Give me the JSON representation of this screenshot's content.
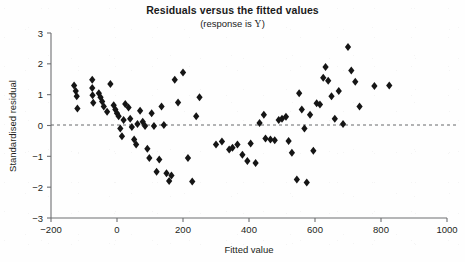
{
  "chart_data": {
    "type": "scatter",
    "title": "Residuals versus the fitted values",
    "subtitle_prefix": "(response is ",
    "subtitle_variable": "Y",
    "subtitle_suffix": ")",
    "xlabel": "Fitted value",
    "ylabel": "Standardised residual",
    "xlim": [
      -200,
      1000
    ],
    "ylim": [
      -3,
      3
    ],
    "xticks": [
      -200,
      0,
      200,
      400,
      600,
      800,
      1000
    ],
    "xtick_labels": [
      "-200",
      "0",
      "200",
      "400",
      "600",
      "800",
      "1000"
    ],
    "yticks": [
      -3,
      -2,
      -1,
      0,
      1,
      2,
      3
    ],
    "ytick_labels": [
      "-3",
      "-2",
      "-1",
      "0",
      "1",
      "2",
      "3"
    ],
    "grid": false,
    "legend": null,
    "reference_line": {
      "orientation": "horizontal",
      "value": 0,
      "style": "dashed"
    },
    "marker": {
      "shape": "diamond",
      "color": "#151515",
      "size": 4
    },
    "points": [
      [
        -130,
        1.3
      ],
      [
        -125,
        1.12
      ],
      [
        -122,
        0.95
      ],
      [
        -120,
        0.55
      ],
      [
        -75,
        1.48
      ],
      [
        -75,
        1.22
      ],
      [
        -74,
        0.98
      ],
      [
        -72,
        0.74
      ],
      [
        -55,
        1.05
      ],
      [
        -50,
        0.92
      ],
      [
        -45,
        0.78
      ],
      [
        -40,
        0.62
      ],
      [
        -30,
        0.45
      ],
      [
        -20,
        1.35
      ],
      [
        -10,
        0.66
      ],
      [
        -5,
        0.52
      ],
      [
        0,
        0.4
      ],
      [
        5,
        0.3
      ],
      [
        10,
        -0.1
      ],
      [
        15,
        -0.35
      ],
      [
        20,
        0.18
      ],
      [
        25,
        0.7
      ],
      [
        35,
        0.58
      ],
      [
        40,
        0.22
      ],
      [
        45,
        -0.05
      ],
      [
        52,
        -0.45
      ],
      [
        58,
        -0.62
      ],
      [
        62,
        0.05
      ],
      [
        70,
        0.48
      ],
      [
        78,
        0.12
      ],
      [
        85,
        -0.02
      ],
      [
        92,
        -0.75
      ],
      [
        98,
        -1.05
      ],
      [
        105,
        0.4
      ],
      [
        112,
        -0.02
      ],
      [
        120,
        -1.5
      ],
      [
        128,
        -1.1
      ],
      [
        135,
        0.62
      ],
      [
        142,
        0.02
      ],
      [
        150,
        -1.55
      ],
      [
        158,
        -1.8
      ],
      [
        165,
        -1.62
      ],
      [
        175,
        1.48
      ],
      [
        185,
        0.75
      ],
      [
        200,
        1.72
      ],
      [
        215,
        -1.05
      ],
      [
        228,
        -1.82
      ],
      [
        240,
        0.3
      ],
      [
        250,
        0.92
      ],
      [
        300,
        -0.62
      ],
      [
        318,
        -0.52
      ],
      [
        340,
        -0.78
      ],
      [
        350,
        -0.72
      ],
      [
        365,
        -0.62
      ],
      [
        380,
        -0.95
      ],
      [
        395,
        -1.15
      ],
      [
        405,
        -0.58
      ],
      [
        420,
        -1.22
      ],
      [
        432,
        0.08
      ],
      [
        445,
        0.35
      ],
      [
        450,
        -0.42
      ],
      [
        465,
        -0.45
      ],
      [
        478,
        -0.48
      ],
      [
        490,
        0.18
      ],
      [
        500,
        0.22
      ],
      [
        512,
        0.28
      ],
      [
        520,
        -0.5
      ],
      [
        530,
        -0.88
      ],
      [
        545,
        -1.75
      ],
      [
        552,
        1.05
      ],
      [
        560,
        0.52
      ],
      [
        568,
        -0.1
      ],
      [
        575,
        -1.85
      ],
      [
        585,
        0.35
      ],
      [
        595,
        -0.82
      ],
      [
        605,
        0.72
      ],
      [
        615,
        0.68
      ],
      [
        625,
        1.55
      ],
      [
        632,
        1.9
      ],
      [
        640,
        1.45
      ],
      [
        650,
        0.95
      ],
      [
        660,
        0.22
      ],
      [
        672,
        1.12
      ],
      [
        685,
        0.05
      ],
      [
        700,
        2.55
      ],
      [
        710,
        1.78
      ],
      [
        722,
        1.42
      ],
      [
        735,
        0.62
      ],
      [
        780,
        1.28
      ],
      [
        825,
        1.3
      ]
    ]
  }
}
